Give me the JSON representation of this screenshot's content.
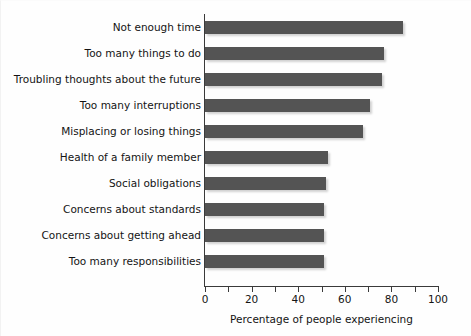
{
  "chart_data": {
    "type": "bar",
    "orientation": "horizontal",
    "title": "",
    "xlabel": "Percentage of people experiencing",
    "ylabel": "",
    "xlim": [
      0,
      100
    ],
    "xticks": [
      0,
      10,
      20,
      30,
      40,
      50,
      60,
      70,
      80,
      90,
      100
    ],
    "xtick_labels": [
      "0",
      "",
      "20",
      "",
      "40",
      "",
      "60",
      "",
      "80",
      "",
      "100"
    ],
    "grid": false,
    "legend": null,
    "bar_color": "#545454",
    "categories": [
      "Not enough time",
      "Too many things to do",
      "Troubling thoughts about the future",
      "Too many interruptions",
      "Misplacing or losing things",
      "Health of a family member",
      "Social obligations",
      "Concerns about standards",
      "Concerns about getting ahead",
      "Too many responsibilities"
    ],
    "values": [
      85,
      77,
      76,
      71,
      68,
      53,
      52,
      51,
      51,
      51
    ]
  }
}
